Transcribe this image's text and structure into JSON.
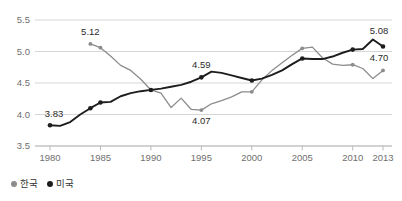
{
  "chart_data": {
    "type": "line",
    "title": "",
    "xlabel": "",
    "ylabel": "",
    "xlim": [
      1980,
      2013
    ],
    "ylim": [
      3.5,
      5.5
    ],
    "grid": true,
    "legend_position": "bottom-left",
    "x_ticks": [
      "1980",
      "1985",
      "1990",
      "1995",
      "2000",
      "2005",
      "2010",
      "2013"
    ],
    "y_ticks": [
      "3.5",
      "4.0",
      "4.5",
      "5.0",
      "5.5"
    ],
    "series": [
      {
        "name": "한국",
        "color": "#8c8c8c",
        "x": [
          1984,
          1985,
          1986,
          1987,
          1988,
          1989,
          1990,
          1991,
          1992,
          1993,
          1994,
          1995,
          1996,
          1997,
          1998,
          1999,
          2000,
          2001,
          2002,
          2003,
          2004,
          2005,
          2006,
          2007,
          2008,
          2009,
          2010,
          2011,
          2012,
          2013
        ],
        "values": [
          5.12,
          5.06,
          4.93,
          4.78,
          4.7,
          4.56,
          4.39,
          4.34,
          4.11,
          4.26,
          4.08,
          4.07,
          4.17,
          4.22,
          4.28,
          4.36,
          4.36,
          4.55,
          4.7,
          4.82,
          4.94,
          5.05,
          5.07,
          4.9,
          4.8,
          4.78,
          4.79,
          4.73,
          4.57,
          4.7
        ]
      },
      {
        "name": "미국",
        "color": "#1d1d1d",
        "x": [
          1980,
          1981,
          1982,
          1983,
          1984,
          1985,
          1986,
          1987,
          1988,
          1989,
          1990,
          1991,
          1992,
          1993,
          1994,
          1995,
          1996,
          1997,
          1998,
          1999,
          2000,
          2001,
          2002,
          2003,
          2004,
          2005,
          2006,
          2007,
          2008,
          2009,
          2010,
          2011,
          2012,
          2013
        ],
        "values": [
          3.83,
          3.82,
          3.88,
          4.0,
          4.1,
          4.19,
          4.2,
          4.29,
          4.34,
          4.37,
          4.39,
          4.41,
          4.44,
          4.47,
          4.52,
          4.59,
          4.68,
          4.66,
          4.62,
          4.58,
          4.54,
          4.57,
          4.63,
          4.7,
          4.8,
          4.89,
          4.88,
          4.88,
          4.92,
          4.98,
          5.03,
          5.04,
          5.19,
          5.08
        ]
      }
    ],
    "annotations": [
      {
        "text": "5.12",
        "x": 1984,
        "y": 5.12,
        "dx": 0,
        "dy": -9,
        "series": "한국"
      },
      {
        "text": "4.07",
        "x": 1995,
        "y": 4.07,
        "dx": 0,
        "dy": 14,
        "series": "한국"
      },
      {
        "text": "4.70",
        "x": 2013,
        "y": 4.7,
        "dx": -4,
        "dy": -9,
        "series": "한국"
      },
      {
        "text": "3.83",
        "x": 1980,
        "y": 3.83,
        "dx": 4,
        "dy": -8,
        "series": "미국"
      },
      {
        "text": "4.59",
        "x": 1995,
        "y": 4.59,
        "dx": 0,
        "dy": -9,
        "series": "미국"
      },
      {
        "text": "5.08",
        "x": 2013,
        "y": 5.08,
        "dx": -4,
        "dy": -12,
        "series": "미국"
      }
    ]
  },
  "legend": {
    "items": [
      {
        "label": "한국",
        "color": "#8c8c8c"
      },
      {
        "label": "미국",
        "color": "#1d1d1d"
      }
    ]
  }
}
